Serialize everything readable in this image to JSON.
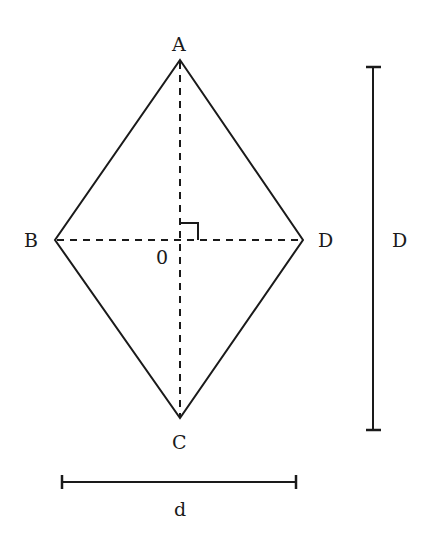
{
  "figure": {
    "vertices": {
      "A": {
        "label": "A",
        "x": 180,
        "y": 60
      },
      "B": {
        "label": "B",
        "x": 55,
        "y": 240
      },
      "C": {
        "label": "C",
        "x": 180,
        "y": 418
      },
      "D": {
        "label": "D",
        "x": 303,
        "y": 240
      }
    },
    "center_label": "0",
    "right_angle_marker": true,
    "dimensions": {
      "long_diagonal": {
        "label": "D",
        "orientation": "vertical"
      },
      "short_diagonal": {
        "label": "d",
        "orientation": "horizontal"
      }
    },
    "colors": {
      "stroke": "#1a1a1a",
      "background": "#ffffff"
    }
  }
}
